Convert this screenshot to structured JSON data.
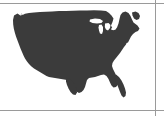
{
  "page": {
    "width": 164,
    "height": 116,
    "background_color": "#ffffff"
  },
  "frame": {
    "rule_color": "#9a9a9a",
    "top_rule_y": 3,
    "bottom_rule_y": 110,
    "right_rule_x": 155
  },
  "map": {
    "title": "United States",
    "subject": "contiguous-united-states",
    "projection_look": "albers-equal-area",
    "land_color": "#3b3b3b",
    "water_color": "#ffffff",
    "outline": "none",
    "labels": [],
    "legend": null,
    "bounds": {
      "left": 13,
      "top": 11,
      "right": 145,
      "bottom": 103
    },
    "features": [
      {
        "name": "mainland-silhouette",
        "visible": true
      },
      {
        "name": "florida-peninsula",
        "visible": true
      },
      {
        "name": "texas-gulf-coast",
        "visible": true
      },
      {
        "name": "great-lakes-cutout",
        "visible": true
      },
      {
        "name": "puget-sound-notch",
        "visible": true
      },
      {
        "name": "great-salt-lake-speck",
        "visible": true
      },
      {
        "name": "chesapeake-bay-notch",
        "visible": true
      },
      {
        "name": "maine-northeast-tip",
        "visible": true
      },
      {
        "name": "cape-cod-long-island",
        "visible": true
      }
    ]
  }
}
